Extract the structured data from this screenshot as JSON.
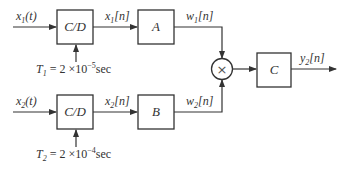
{
  "diagram": {
    "type": "block-diagram",
    "branch1": {
      "input": {
        "base": "x",
        "sub": "1",
        "arg": "(t)"
      },
      "cd_block": "C/D",
      "sample_label": {
        "base": "T",
        "sub": "1",
        "eq": " = 2 ×10",
        "exp": "−5",
        "unit": "sec"
      },
      "discrete_signal": {
        "base": "x",
        "sub": "1",
        "arg": "[n]"
      },
      "system_block": "A",
      "output": {
        "base": "w",
        "sub": "1",
        "arg": "[n]"
      }
    },
    "branch2": {
      "input": {
        "base": "x",
        "sub": "2",
        "arg": "(t)"
      },
      "cd_block": "C/D",
      "sample_label": {
        "base": "T",
        "sub": "2",
        "eq": " = 2 ×10",
        "exp": "−4",
        "unit": "sec"
      },
      "discrete_signal": {
        "base": "x",
        "sub": "2",
        "arg": "[n]"
      },
      "system_block": "B",
      "output": {
        "base": "w",
        "sub": "2",
        "arg": "[n]"
      }
    },
    "multiplier": "×",
    "final_block": "C",
    "final_output": {
      "base": "y",
      "sub": "2",
      "arg": "[n]"
    }
  }
}
